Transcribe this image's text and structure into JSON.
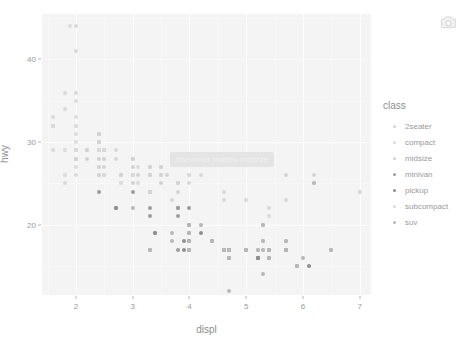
{
  "modebar": {
    "buttons": [
      {
        "name": "download-plot-png",
        "label": "Download plot as a png",
        "icon": "camera-icon"
      }
    ]
  },
  "tooltip": {
    "visible": true,
    "text": "chevrolet malibu midsize",
    "background": "#e4e4e4",
    "text_color": "#f2f2f2"
  },
  "legend": {
    "title": "class",
    "position": "right",
    "items": [
      {
        "label": "2seater",
        "color": "#d6d6d6"
      },
      {
        "label": "compact",
        "color": "#dcdcdc"
      },
      {
        "label": "midsize",
        "color": "#d2d2d2"
      },
      {
        "label": "minivan",
        "color": "#9c9c9c"
      },
      {
        "label": "pickup",
        "color": "#8f8f8f"
      },
      {
        "label": "subcompact",
        "color": "#d9d9d9"
      },
      {
        "label": "suv",
        "color": "#b8b8b8"
      }
    ]
  },
  "chart_data": {
    "type": "scatter",
    "title": "",
    "xlabel": "displ",
    "ylabel": "hwy",
    "xlim": [
      1.4,
      7.2
    ],
    "ylim": [
      11.5,
      45.5
    ],
    "xticks": [
      2,
      3,
      4,
      5,
      6,
      7
    ],
    "yticks": [
      20,
      30,
      40
    ],
    "grid": true,
    "panel_background": "#f4f4f4",
    "legend_title": "class",
    "series": [
      {
        "name": "2seater",
        "color": "#d6d6d6",
        "points": [
          [
            5.7,
            26
          ],
          [
            5.7,
            23
          ],
          [
            6.2,
            26
          ],
          [
            6.2,
            25
          ],
          [
            7.0,
            24
          ]
        ]
      },
      {
        "name": "compact",
        "color": "#dcdcdc",
        "points": [
          [
            1.8,
            29
          ],
          [
            1.8,
            29
          ],
          [
            2.0,
            31
          ],
          [
            2.0,
            30
          ],
          [
            2.8,
            26
          ],
          [
            2.8,
            26
          ],
          [
            3.1,
            27
          ],
          [
            1.8,
            26
          ],
          [
            1.8,
            25
          ],
          [
            2.0,
            28
          ],
          [
            2.0,
            27
          ],
          [
            2.8,
            25
          ],
          [
            2.8,
            25
          ],
          [
            3.1,
            25
          ],
          [
            3.1,
            25
          ],
          [
            2.4,
            27
          ],
          [
            2.4,
            26
          ],
          [
            2.5,
            26
          ],
          [
            2.5,
            26
          ],
          [
            3.3,
            26
          ],
          [
            2.0,
            33
          ],
          [
            2.0,
            35
          ],
          [
            2.0,
            32
          ],
          [
            2.0,
            32
          ],
          [
            2.5,
            29
          ],
          [
            2.5,
            29
          ],
          [
            2.5,
            29
          ],
          [
            2.5,
            29
          ],
          [
            2.5,
            28
          ],
          [
            2.2,
            29
          ],
          [
            2.2,
            29
          ],
          [
            2.4,
            31
          ],
          [
            2.4,
            30
          ],
          [
            2.4,
            29
          ],
          [
            2.4,
            29
          ],
          [
            2.0,
            28
          ],
          [
            2.0,
            29
          ],
          [
            2.0,
            29
          ],
          [
            2.0,
            29
          ],
          [
            2.8,
            26
          ],
          [
            1.9,
            44
          ],
          [
            2.0,
            29
          ],
          [
            2.0,
            29
          ],
          [
            2.5,
            29
          ],
          [
            2.5,
            29
          ],
          [
            1.8,
            26
          ],
          [
            1.8,
            25
          ],
          [
            2.0,
            28
          ]
        ]
      },
      {
        "name": "midsize",
        "color": "#d2d2d2",
        "points": [
          [
            2.4,
            31
          ],
          [
            3.0,
            28
          ],
          [
            3.3,
            27
          ],
          [
            3.8,
            25
          ],
          [
            2.4,
            30
          ],
          [
            2.4,
            29
          ],
          [
            3.1,
            26
          ],
          [
            3.5,
            26
          ],
          [
            2.4,
            31
          ],
          [
            2.4,
            30
          ],
          [
            3.0,
            28
          ],
          [
            3.0,
            26
          ],
          [
            3.5,
            27
          ],
          [
            3.6,
            26
          ],
          [
            2.4,
            29
          ],
          [
            2.4,
            28
          ],
          [
            3.0,
            27
          ],
          [
            3.3,
            26
          ],
          [
            3.8,
            25
          ],
          [
            2.5,
            27
          ],
          [
            2.5,
            28
          ],
          [
            3.5,
            26
          ],
          [
            3.5,
            27
          ],
          [
            2.2,
            29
          ],
          [
            2.2,
            28
          ],
          [
            2.4,
            27
          ],
          [
            2.4,
            26
          ],
          [
            3.0,
            26
          ],
          [
            3.0,
            25
          ],
          [
            3.5,
            25
          ],
          [
            3.8,
            24
          ],
          [
            2.4,
            30
          ],
          [
            2.4,
            29
          ],
          [
            3.3,
            26
          ],
          [
            3.3,
            27
          ],
          [
            3.8,
            25
          ],
          [
            2.0,
            29
          ],
          [
            2.0,
            28
          ],
          [
            2.8,
            26
          ]
        ]
      },
      {
        "name": "minivan",
        "color": "#9c9c9c",
        "points": [
          [
            2.4,
            24
          ],
          [
            3.0,
            24
          ],
          [
            3.3,
            24
          ],
          [
            3.8,
            22
          ],
          [
            3.8,
            22
          ],
          [
            4.0,
            22
          ],
          [
            3.3,
            22
          ],
          [
            3.3,
            21
          ],
          [
            3.8,
            21
          ],
          [
            3.3,
            17
          ],
          [
            3.8,
            17
          ],
          [
            4.0,
            17
          ]
        ]
      },
      {
        "name": "pickup",
        "color": "#8f8f8f",
        "points": [
          [
            2.7,
            22
          ],
          [
            2.7,
            22
          ],
          [
            3.4,
            19
          ],
          [
            3.4,
            19
          ],
          [
            4.0,
            18
          ],
          [
            4.0,
            18
          ],
          [
            4.7,
            17
          ],
          [
            4.7,
            17
          ],
          [
            4.7,
            17
          ],
          [
            5.2,
            16
          ],
          [
            5.2,
            16
          ],
          [
            3.9,
            18
          ],
          [
            3.9,
            17
          ],
          [
            4.7,
            17
          ],
          [
            4.7,
            17
          ],
          [
            4.7,
            16
          ],
          [
            5.2,
            16
          ],
          [
            5.7,
            17
          ],
          [
            5.9,
            15
          ],
          [
            4.7,
            17
          ],
          [
            4.7,
            17
          ],
          [
            4.7,
            17
          ],
          [
            5.2,
            16
          ],
          [
            5.2,
            16
          ],
          [
            5.7,
            17
          ],
          [
            5.7,
            17
          ],
          [
            6.1,
            15
          ],
          [
            4.0,
            19
          ],
          [
            4.0,
            20
          ],
          [
            4.6,
            17
          ],
          [
            5.0,
            17
          ],
          [
            4.2,
            19
          ],
          [
            4.4,
            18
          ],
          [
            4.6,
            17
          ],
          [
            5.4,
            17
          ],
          [
            5.4,
            16
          ]
        ]
      },
      {
        "name": "subcompact",
        "color": "#d9d9d9",
        "points": [
          [
            1.6,
            33
          ],
          [
            1.6,
            32
          ],
          [
            1.6,
            32
          ],
          [
            1.6,
            29
          ],
          [
            1.6,
            32
          ],
          [
            1.8,
            34
          ],
          [
            1.8,
            36
          ],
          [
            2.0,
            36
          ],
          [
            2.4,
            29
          ],
          [
            2.4,
            29
          ],
          [
            2.5,
            29
          ],
          [
            2.5,
            29
          ],
          [
            3.3,
            24
          ],
          [
            2.0,
            44
          ],
          [
            2.0,
            41
          ],
          [
            2.0,
            29
          ],
          [
            2.0,
            26
          ],
          [
            2.7,
            28
          ],
          [
            2.7,
            29
          ],
          [
            3.0,
            26
          ],
          [
            3.7,
            23
          ],
          [
            4.0,
            26
          ],
          [
            4.2,
            26
          ],
          [
            4.6,
            23
          ],
          [
            5.4,
            22
          ],
          [
            5.4,
            21
          ],
          [
            4.0,
            26
          ],
          [
            4.0,
            25
          ],
          [
            4.6,
            24
          ],
          [
            5.0,
            23
          ],
          [
            2.0,
            29
          ],
          [
            2.0,
            29
          ],
          [
            2.5,
            29
          ],
          [
            2.5,
            29
          ],
          [
            2.5,
            26
          ]
        ]
      },
      {
        "name": "suv",
        "color": "#b8b8b8",
        "points": [
          [
            4.0,
            17
          ],
          [
            4.0,
            17
          ],
          [
            4.6,
            17
          ],
          [
            4.6,
            17
          ],
          [
            4.6,
            17
          ],
          [
            5.4,
            17
          ],
          [
            3.0,
            22
          ],
          [
            3.7,
            19
          ],
          [
            3.7,
            18
          ],
          [
            4.0,
            18
          ],
          [
            4.7,
            17
          ],
          [
            4.7,
            17
          ],
          [
            4.7,
            17
          ],
          [
            5.2,
            17
          ],
          [
            5.2,
            17
          ],
          [
            5.7,
            17
          ],
          [
            5.9,
            15
          ],
          [
            4.6,
            17
          ],
          [
            5.4,
            17
          ],
          [
            5.4,
            17
          ],
          [
            4.0,
            19
          ],
          [
            4.0,
            20
          ],
          [
            4.0,
            17
          ],
          [
            4.6,
            17
          ],
          [
            5.0,
            17
          ],
          [
            4.2,
            20
          ],
          [
            4.4,
            18
          ],
          [
            4.6,
            17
          ],
          [
            5.4,
            17
          ],
          [
            5.4,
            16
          ],
          [
            3.3,
            17
          ],
          [
            3.3,
            17
          ],
          [
            4.0,
            17
          ],
          [
            4.7,
            16
          ],
          [
            4.7,
            16
          ],
          [
            4.7,
            16
          ],
          [
            5.7,
            17
          ],
          [
            6.5,
            17
          ],
          [
            5.3,
            18
          ],
          [
            5.3,
            18
          ],
          [
            5.3,
            17
          ],
          [
            5.7,
            17
          ],
          [
            6.0,
            16
          ],
          [
            5.3,
            17
          ],
          [
            6.2,
            25
          ],
          [
            5.3,
            14
          ],
          [
            4.7,
            12
          ],
          [
            5.3,
            20
          ],
          [
            5.3,
            20
          ],
          [
            5.7,
            18
          ],
          [
            5.7,
            18
          ],
          [
            6.5,
            17
          ]
        ]
      }
    ]
  }
}
